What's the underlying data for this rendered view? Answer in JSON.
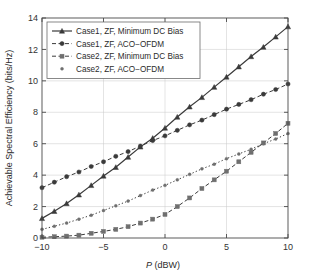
{
  "chart_data": {
    "type": "line",
    "title": "",
    "xlabel": "P (dBW)",
    "ylabel": "Achievable Spectral Efficiency (bits/Hz)",
    "xlim": [
      -10,
      10
    ],
    "ylim": [
      0,
      14
    ],
    "xticks": [
      -10,
      -5,
      0,
      5,
      10
    ],
    "xticklabels": [
      "-10",
      "-5",
      "0",
      "5",
      "10"
    ],
    "yticks": [
      0,
      2,
      4,
      6,
      8,
      10,
      12,
      14
    ],
    "yticklabels": [
      "0",
      "2",
      "4",
      "6",
      "8",
      "10",
      "12",
      "14"
    ],
    "grid": true,
    "legend_position": "upper-left",
    "x": [
      -10,
      -9,
      -8,
      -7,
      -6,
      -5,
      -4,
      -3,
      -2,
      -1,
      0,
      1,
      2,
      3,
      4,
      5,
      6,
      7,
      8,
      9,
      10
    ],
    "series": [
      {
        "name": "Case1, ZF, Minimum DC Bias",
        "marker": "triangle",
        "linestyle": "solid",
        "color": "#3a3a3a",
        "values": [
          1.25,
          1.7,
          2.2,
          2.75,
          3.35,
          3.95,
          4.5,
          5.15,
          5.8,
          6.35,
          7.0,
          7.7,
          8.35,
          8.95,
          9.6,
          10.25,
          10.9,
          11.55,
          12.15,
          12.8,
          13.45
        ]
      },
      {
        "name": "Case1, ZF, ACO-OFDM",
        "marker": "circle",
        "linestyle": "dashed",
        "color": "#3a3a3a",
        "values": [
          3.2,
          3.55,
          3.9,
          4.2,
          4.55,
          4.85,
          5.2,
          5.5,
          5.85,
          6.2,
          6.5,
          6.85,
          7.2,
          7.5,
          7.85,
          8.2,
          8.5,
          8.8,
          9.15,
          9.45,
          9.8
        ]
      },
      {
        "name": "Case2, ZF, Minimum DC Bias",
        "marker": "square",
        "linestyle": "dashed",
        "color": "#6f6f6f",
        "values": [
          0.05,
          0.08,
          0.12,
          0.18,
          0.3,
          0.42,
          0.55,
          0.72,
          0.95,
          1.2,
          1.5,
          2.0,
          2.55,
          3.15,
          3.7,
          4.25,
          4.85,
          5.45,
          6.05,
          6.65,
          7.3
        ]
      },
      {
        "name": "Case2, ZF, ACO-OFDM",
        "marker": "dot",
        "linestyle": "dotted",
        "color": "#6f6f6f",
        "values": [
          0.55,
          0.75,
          0.95,
          1.2,
          1.45,
          1.75,
          2.05,
          2.35,
          2.7,
          3.05,
          3.35,
          3.7,
          4.05,
          4.4,
          4.7,
          5.05,
          5.35,
          5.65,
          6.0,
          6.3,
          6.65
        ]
      }
    ]
  },
  "legend": {
    "entries": [
      "Case1, ZF, Minimum DC Bias",
      "Case1, ZF, ACO−OFDM",
      "Case2, ZF, Minimum DC Bias",
      "Case2, ZF, ACO−OFDM"
    ]
  },
  "axes": {
    "x_title_italic": "P",
    "x_title_rest": " (dBW)",
    "y_title": "Achievable Spectral Efficiency (bits/Hz)"
  }
}
